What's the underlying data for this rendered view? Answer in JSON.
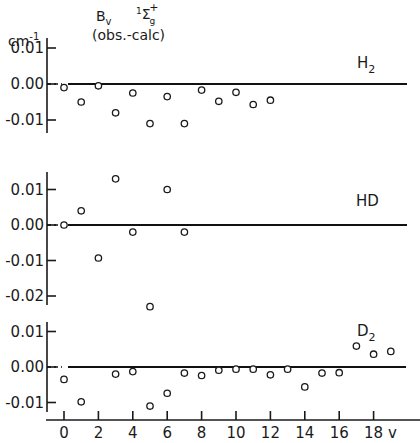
{
  "title": {
    "unit": "cm",
    "unit_exp": "-1",
    "quantity": "B",
    "quantity_sub": "v",
    "subtitle": "(obs.-calc)",
    "state_pre": "1",
    "state": "Σ",
    "state_sub": "g",
    "state_sup": "+"
  },
  "x_axis": {
    "label": "v",
    "ticks": [
      "0",
      "2",
      "4",
      "6",
      "8",
      "10",
      "12",
      "14",
      "16",
      "18"
    ]
  },
  "panels": [
    {
      "label": "H",
      "label_sub": "2",
      "ticks": [
        "0.01",
        "0.00",
        "-0.01"
      ]
    },
    {
      "label": "HD",
      "label_sub": "",
      "ticks": [
        "0.01",
        "0.00",
        "-0.01",
        "-0.02"
      ]
    },
    {
      "label": "D",
      "label_sub": "2",
      "ticks": [
        "0.01",
        "0.00",
        "-0.01"
      ]
    }
  ],
  "chart_data": {
    "type": "scatter",
    "xlabel": "v",
    "ylabel": "cm^-1",
    "xlim": [
      -0.5,
      20
    ],
    "grid": false,
    "panels": [
      {
        "name": "H2",
        "ylim": [
          -0.013,
          0.013
        ],
        "yticks": [
          0.01,
          0.0,
          -0.01
        ],
        "x": [
          0,
          1,
          2,
          3,
          4,
          5,
          6,
          7,
          8,
          9,
          10,
          11,
          12
        ],
        "y": [
          -0.001,
          -0.005,
          -0.0005,
          -0.008,
          -0.0025,
          -0.011,
          -0.0035,
          -0.011,
          -0.0017,
          -0.0048,
          -0.0023,
          -0.0057,
          -0.0045
        ]
      },
      {
        "name": "HD",
        "ylim": [
          -0.023,
          0.015
        ],
        "yticks": [
          0.01,
          0.0,
          -0.01,
          -0.02
        ],
        "x": [
          0,
          1,
          2,
          3,
          4,
          5,
          6,
          7
        ],
        "y": [
          0.0,
          0.004,
          -0.0093,
          0.013,
          -0.002,
          -0.023,
          0.01,
          -0.002
        ]
      },
      {
        "name": "D2",
        "ylim": [
          -0.012,
          0.012
        ],
        "yticks": [
          0.01,
          0.0,
          -0.01
        ],
        "x": [
          0,
          1,
          3,
          4,
          5,
          6,
          7,
          8,
          9,
          10,
          11,
          12,
          13,
          14,
          15,
          16,
          17,
          18,
          19
        ],
        "y": [
          -0.0035,
          -0.0098,
          -0.002,
          -0.0013,
          -0.011,
          -0.0074,
          -0.0017,
          -0.0024,
          -0.0009,
          -0.0006,
          -0.0006,
          -0.0022,
          -0.0006,
          -0.0056,
          -0.0017,
          -0.0016,
          0.0059,
          0.0036,
          0.0044
        ]
      }
    ]
  }
}
